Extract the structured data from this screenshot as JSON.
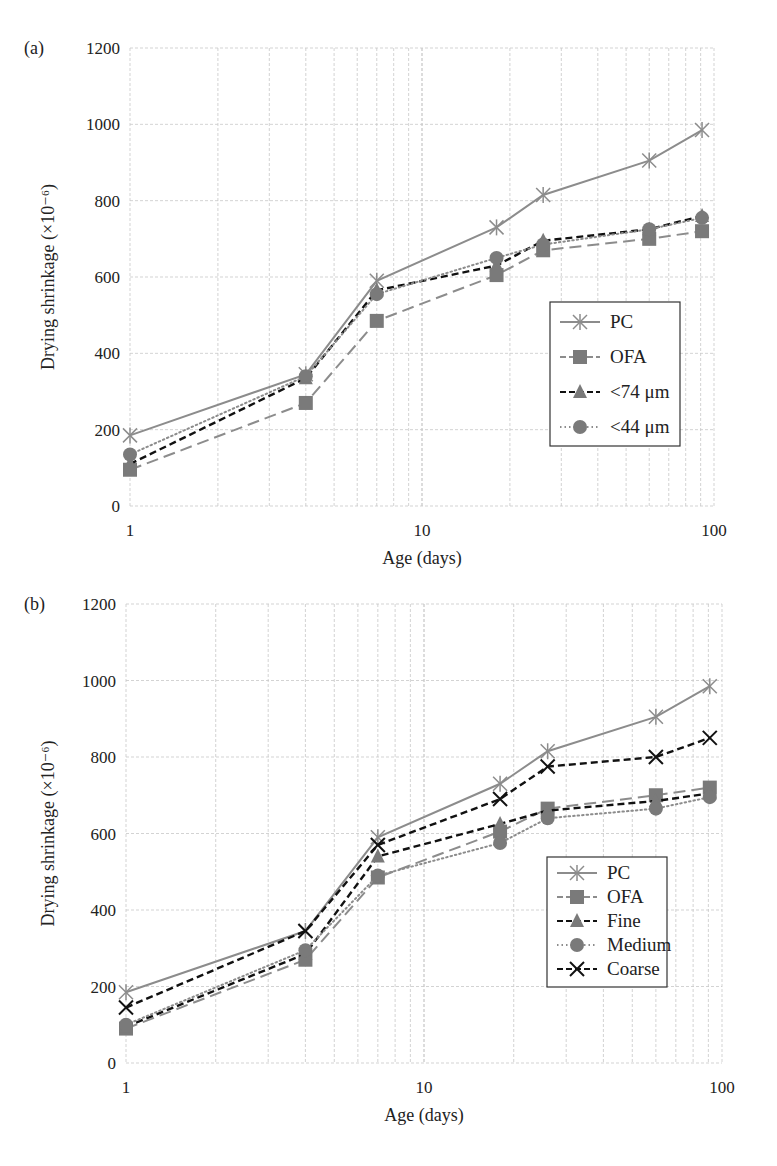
{
  "chart_data": [
    {
      "panel": "(a)",
      "type": "line",
      "xscale": "log",
      "xlabel": "Age (days)",
      "ylabel": "Drying shrinkage (×10⁻⁶)",
      "xlim": [
        1,
        100
      ],
      "ylim": [
        0,
        1200
      ],
      "xticks": [
        "1",
        "10",
        "100"
      ],
      "yticks": [
        "0",
        "200",
        "400",
        "600",
        "800",
        "1000",
        "1200"
      ],
      "grid": true,
      "legend_position": "right-middle",
      "x": [
        1,
        4,
        7,
        18,
        26,
        60,
        91
      ],
      "series": [
        {
          "name": "PC",
          "marker": "asterisk",
          "line": "solid",
          "color": "#8c8c8c",
          "values": [
            185,
            345,
            590,
            730,
            815,
            905,
            985
          ]
        },
        {
          "name": "OFA",
          "marker": "square",
          "line": "longdash",
          "color": "#8c8c8c",
          "values": [
            95,
            270,
            485,
            605,
            670,
            700,
            720
          ]
        },
        {
          "name": "<74 μm",
          "marker": "triangle",
          "line": "dashed",
          "color": "#111111",
          "values": [
            110,
            335,
            565,
            630,
            695,
            725,
            760
          ]
        },
        {
          "name": "<44 μm",
          "marker": "circle",
          "line": "dotted",
          "color": "#8c8c8c",
          "values": [
            135,
            340,
            555,
            650,
            685,
            725,
            755
          ]
        }
      ]
    },
    {
      "panel": "(b)",
      "type": "line",
      "xscale": "log",
      "xlabel": "Age (days)",
      "ylabel": "Drying shrinkage (×10⁻⁶)",
      "xlim": [
        1,
        100
      ],
      "ylim": [
        0,
        1200
      ],
      "xticks": [
        "1",
        "10",
        "100"
      ],
      "yticks": [
        "0",
        "200",
        "400",
        "600",
        "800",
        "1000",
        "1200"
      ],
      "grid": true,
      "legend_position": "right-middle",
      "x": [
        1,
        4,
        7,
        18,
        26,
        60,
        91
      ],
      "series": [
        {
          "name": "PC",
          "marker": "asterisk",
          "line": "solid",
          "color": "#8c8c8c",
          "values": [
            185,
            345,
            590,
            730,
            815,
            905,
            985
          ]
        },
        {
          "name": "OFA",
          "marker": "square",
          "line": "longdash",
          "color": "#8c8c8c",
          "values": [
            90,
            270,
            485,
            605,
            665,
            700,
            720
          ]
        },
        {
          "name": "Fine",
          "marker": "triangle",
          "line": "dashed",
          "color": "#111111",
          "values": [
            95,
            285,
            540,
            625,
            660,
            685,
            705
          ]
        },
        {
          "name": "Medium",
          "marker": "circle",
          "line": "dotted",
          "color": "#8c8c8c",
          "values": [
            100,
            295,
            490,
            575,
            640,
            665,
            695
          ]
        },
        {
          "name": "Coarse",
          "marker": "x",
          "line": "dashed",
          "color": "#111111",
          "values": [
            145,
            345,
            570,
            690,
            775,
            800,
            850
          ]
        }
      ]
    }
  ]
}
